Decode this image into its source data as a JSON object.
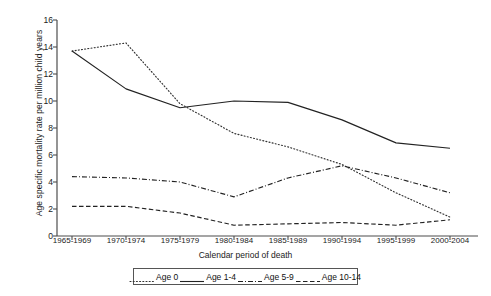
{
  "chart_data": {
    "type": "line",
    "title": "",
    "xlabel": "Calendar period of death",
    "ylabel": "Age specific mortality rate per million child years",
    "categories": [
      "1965-1969",
      "1970-1974",
      "1975-1979",
      "1980-1984",
      "1985-1989",
      "1990-1994",
      "1995-1999",
      "2000-2004"
    ],
    "ylim": [
      0,
      16
    ],
    "yticks": [
      0,
      2,
      4,
      6,
      8,
      10,
      12,
      14,
      16
    ],
    "grid": false,
    "legend_position": "bottom",
    "series": [
      {
        "name": "Age 0",
        "style": "dotted",
        "color": "#333333",
        "values": [
          13.7,
          14.3,
          9.8,
          7.6,
          6.6,
          5.3,
          3.2,
          1.4
        ]
      },
      {
        "name": "Age 1-4",
        "style": "solid",
        "color": "#222222",
        "values": [
          13.7,
          10.9,
          9.5,
          10.0,
          9.9,
          8.6,
          6.9,
          6.5
        ]
      },
      {
        "name": "Age 5-9",
        "style": "dashdot",
        "color": "#222222",
        "values": [
          4.4,
          4.3,
          4.0,
          2.9,
          4.3,
          5.2,
          4.3,
          3.2
        ]
      },
      {
        "name": "Age 10-14",
        "style": "dashed",
        "color": "#222222",
        "values": [
          2.2,
          2.2,
          1.7,
          0.8,
          0.9,
          1.0,
          0.8,
          1.2
        ]
      }
    ]
  },
  "legend": {
    "items": [
      {
        "label": "Age 0",
        "style": "dotted"
      },
      {
        "label": "Age 1-4",
        "style": "solid"
      },
      {
        "label": "Age 5-9",
        "style": "dashdot"
      },
      {
        "label": "Age 10-14",
        "style": "dashed"
      }
    ]
  },
  "axis": {
    "y_tick_labels": [
      "16",
      "14",
      "12",
      "10",
      "8",
      "6",
      "4",
      "2",
      "0"
    ],
    "x_tick_labels": [
      "1965-1969",
      "1970-1974",
      "1975-1979",
      "1980-1984",
      "1985-1989",
      "1990-1994",
      "1995-1999",
      "2000-2004"
    ]
  }
}
